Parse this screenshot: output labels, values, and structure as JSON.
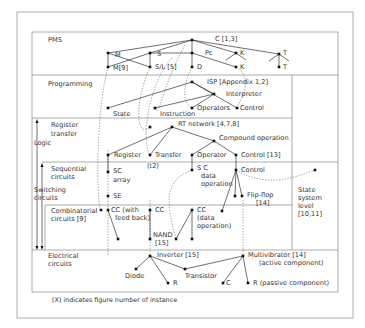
{
  "caption": "[X] indicates figure number of instance",
  "levels": {
    "pms": "PMS",
    "programming": "Programming",
    "register_transfer": [
      "Register",
      "transfer"
    ],
    "logic": "Logic",
    "sequential": [
      "Sequential",
      "circuits"
    ],
    "switching": [
      "Switching",
      "circuits"
    ],
    "combinatorial": [
      "Combinatorial",
      "circuits [9]"
    ],
    "electrical": [
      "Electrical",
      "circuits"
    ],
    "state_system": [
      "State",
      "system",
      "level",
      "[10,11]"
    ]
  },
  "nodes": [
    {
      "id": "C",
      "x": 192,
      "y": 40,
      "label": "C [1,3]",
      "lx": 215,
      "ly": 41
    },
    {
      "id": "M",
      "x": 108,
      "y": 53,
      "label": "M",
      "lx": 115,
      "ly": 57
    },
    {
      "id": "S",
      "x": 150,
      "y": 53,
      "label": "S",
      "lx": 157,
      "ly": 56
    },
    {
      "id": "Pc",
      "x": 192,
      "y": 53,
      "label": "Pc",
      "lx": 205,
      "ly": 55
    },
    {
      "id": "K1",
      "x": 236,
      "y": 53,
      "label": "K",
      "lx": 240,
      "ly": 55
    },
    {
      "id": "T1",
      "x": 279,
      "y": 54,
      "label": "T",
      "lx": 283,
      "ly": 55
    },
    {
      "id": "M9",
      "x": 108,
      "y": 67,
      "label": "M[9]",
      "lx": 113,
      "ly": 70
    },
    {
      "id": "SL",
      "x": 150,
      "y": 67,
      "label": "S/L [5]",
      "lx": 155,
      "ly": 69
    },
    {
      "id": "D",
      "x": 192,
      "y": 67,
      "label": "D",
      "lx": 197,
      "ly": 69
    },
    {
      "id": "K2",
      "x": 236,
      "y": 67,
      "label": "K",
      "lx": 240,
      "ly": 69
    },
    {
      "id": "T2",
      "x": 279,
      "y": 67,
      "label": "T",
      "lx": 283,
      "ly": 69
    },
    {
      "id": "ISP",
      "x": 192,
      "y": 82,
      "label": "ISP [Appendix 1,2]",
      "lx": 207,
      "ly": 84
    },
    {
      "id": "Interp",
      "x": 214,
      "y": 94,
      "label": "Interpreter",
      "lx": 226,
      "ly": 96
    },
    {
      "id": "State",
      "x": 108,
      "y": 108,
      "label": "State",
      "lx": 113,
      "ly": 116
    },
    {
      "id": "Instr",
      "x": 155,
      "y": 108,
      "label": "Instruction",
      "lx": 160,
      "ly": 116
    },
    {
      "id": "Oper",
      "x": 192,
      "y": 108,
      "label": "Operators",
      "lx": 197,
      "ly": 110
    },
    {
      "id": "Ctrl1",
      "x": 237,
      "y": 108,
      "label": "Control",
      "lx": 240,
      "ly": 110
    },
    {
      "id": "RTdot",
      "x": 150,
      "y": 127,
      "label": "",
      "lx": 0,
      "ly": 0
    },
    {
      "id": "RT",
      "x": 172,
      "y": 127,
      "label": "RT network  [4,7,8]",
      "lx": 178,
      "ly": 126
    },
    {
      "id": "Comp",
      "x": 214,
      "y": 141,
      "label": "Compound operation",
      "lx": 219,
      "ly": 140
    },
    {
      "id": "Reg",
      "x": 108,
      "y": 155,
      "label": "Register",
      "lx": 114,
      "ly": 157
    },
    {
      "id": "Trans",
      "x": 150,
      "y": 155,
      "label": "Transfer",
      "lx": 155,
      "ly": 157
    },
    {
      "id": "Operator",
      "x": 192,
      "y": 155,
      "label": "Operator",
      "lx": 197,
      "ly": 157
    },
    {
      "id": "Ctrl13",
      "x": 236,
      "y": 155,
      "label": "Control [13]",
      "lx": 241,
      "ly": 157
    },
    {
      "id": "SCarr",
      "x": 108,
      "y": 172,
      "label": "",
      "lx": 0,
      "ly": 0
    },
    {
      "id": "SCdata",
      "x": 192,
      "y": 170,
      "label": "",
      "lx": 0,
      "ly": 0
    },
    {
      "id": "Ctrl2",
      "x": 236,
      "y": 170,
      "label": "Control",
      "lx": 241,
      "ly": 172
    },
    {
      "id": "FarR",
      "x": 315,
      "y": 170,
      "label": "",
      "lx": 0,
      "ly": 0
    },
    {
      "id": "FF1",
      "x": 235,
      "y": 196,
      "label": "",
      "lx": 0,
      "ly": 0
    },
    {
      "id": "FF2",
      "x": 242,
      "y": 196,
      "label": "",
      "lx": 0,
      "ly": 0
    },
    {
      "id": "SE",
      "x": 108,
      "y": 196,
      "label": "SE",
      "lx": 113,
      "ly": 198
    },
    {
      "id": "CCfb",
      "x": 108,
      "y": 210,
      "label": "",
      "lx": 0,
      "ly": 0
    },
    {
      "id": "CCleft",
      "x": 101,
      "y": 210,
      "label": "",
      "lx": 0,
      "ly": 0
    },
    {
      "id": "CCfbEnd",
      "x": 118,
      "y": 239,
      "label": "",
      "lx": 0,
      "ly": 0
    },
    {
      "id": "CC",
      "x": 150,
      "y": 210,
      "label": "CC",
      "lx": 155,
      "ly": 212
    },
    {
      "id": "CCdata",
      "x": 192,
      "y": 210,
      "label": "",
      "lx": 0,
      "ly": 0
    },
    {
      "id": "CCdataDot",
      "x": 222,
      "y": 211,
      "label": "",
      "lx": 0,
      "ly": 0
    },
    {
      "id": "NAND",
      "x": 150,
      "y": 239,
      "label": "",
      "lx": 0,
      "ly": 0
    },
    {
      "id": "CCd1",
      "x": 176,
      "y": 239,
      "label": "",
      "lx": 0,
      "ly": 0
    },
    {
      "id": "CCd2",
      "x": 192,
      "y": 239,
      "label": "",
      "lx": 0,
      "ly": 0
    },
    {
      "id": "Inv",
      "x": 150,
      "y": 256,
      "label": "Inverter [15]",
      "lx": 157,
      "ly": 257
    },
    {
      "id": "Diode",
      "x": 136,
      "y": 269,
      "label": "Diode",
      "lx": 125,
      "ly": 278
    },
    {
      "id": "R1",
      "x": 168,
      "y": 283,
      "label": "R",
      "lx": 173,
      "ly": 285
    },
    {
      "id": "Transistor",
      "x": 185,
      "y": 269,
      "label": "Transistor",
      "lx": 185,
      "ly": 278
    },
    {
      "id": "Multi",
      "x": 243,
      "y": 256,
      "label": "Multivibrator [14]",
      "lx": 248,
      "ly": 257
    },
    {
      "id": "C2",
      "x": 223,
      "y": 283,
      "label": "C",
      "lx": 226,
      "ly": 285
    },
    {
      "id": "R2",
      "x": 248,
      "y": 283,
      "label": "R  (passive component)",
      "lx": 253,
      "ly": 285
    }
  ],
  "extra_labels": [
    {
      "text": "SC",
      "x": 113,
      "y": 173
    },
    {
      "text": "array",
      "x": 113,
      "y": 182
    },
    {
      "text": "(t2)",
      "x": 147,
      "y": 168
    },
    {
      "text": "S C",
      "x": 197,
      "y": 170
    },
    {
      "text": "data",
      "x": 201,
      "y": 178
    },
    {
      "text": "operation",
      "x": 201,
      "y": 186
    },
    {
      "text": "Flip-flop",
      "x": 247,
      "y": 197
    },
    {
      "text": "[14]",
      "x": 256,
      "y": 205
    },
    {
      "text": "CC (with",
      "x": 111,
      "y": 212
    },
    {
      "text": "feed back)",
      "x": 115,
      "y": 220
    },
    {
      "text": "CC",
      "x": 197,
      "y": 212
    },
    {
      "text": "(data",
      "x": 197,
      "y": 220
    },
    {
      "text": "operation)",
      "x": 197,
      "y": 228
    },
    {
      "text": "NAND",
      "x": 153,
      "y": 237
    },
    {
      "text": "[15]",
      "x": 155,
      "y": 245
    },
    {
      "text": "(active component)",
      "x": 259,
      "y": 265
    }
  ],
  "edges": [
    [
      "C",
      "M"
    ],
    [
      "C",
      "S"
    ],
    [
      "C",
      "Pc"
    ],
    [
      "C",
      "K1"
    ],
    [
      "C",
      "T1"
    ],
    [
      "M",
      "M9"
    ],
    [
      "M",
      "SL"
    ],
    [
      "S",
      "M9"
    ],
    [
      "S",
      "SL"
    ],
    [
      "S",
      "Pc"
    ],
    [
      "Pc",
      "D"
    ],
    [
      "Pc",
      "K2"
    ],
    [
      "T1",
      "T2"
    ],
    [
      "ISP",
      "State"
    ],
    [
      "ISP",
      "Interp"
    ],
    [
      "Interp",
      "Instr"
    ],
    [
      "Interp",
      "Oper"
    ],
    [
      "ISP",
      "Ctrl1"
    ],
    [
      "RT",
      "Reg"
    ],
    [
      "RT",
      "Trans"
    ],
    [
      "RT",
      "Comp"
    ],
    [
      "Comp",
      "Operator"
    ],
    [
      "Comp",
      "Ctrl13"
    ],
    [
      "Reg",
      "SCarr"
    ],
    [
      "Operator",
      "SCdata"
    ],
    [
      "Ctrl13",
      "Ctrl2"
    ],
    [
      "Ctrl2",
      "FF1"
    ],
    [
      "Ctrl2",
      "FF2"
    ],
    [
      "Ctrl2",
      "CCdataDot"
    ],
    [
      "CCfb",
      "CCfbEnd"
    ],
    [
      "CC",
      "NAND"
    ],
    [
      "CCdata",
      "CCd1"
    ],
    [
      "CCdata",
      "CCd2"
    ],
    [
      "Inv",
      "Diode"
    ],
    [
      "Inv",
      "R1"
    ],
    [
      "Inv",
      "Transistor"
    ],
    [
      "Transistor",
      "Multi"
    ],
    [
      "Multi",
      "C2"
    ],
    [
      "Multi",
      "R2"
    ]
  ],
  "stubs": [
    [
      236,
      53,
      226,
      60
    ],
    [
      236,
      53,
      246,
      60
    ],
    [
      279,
      54,
      269,
      61
    ],
    [
      279,
      54,
      289,
      61
    ]
  ],
  "dashed": [
    "M108,67 C96,110 96,200 101,210",
    "M150,67 C135,100 135,140 150,127",
    "M172,58 C150,80 140,140 150,155",
    "M185,45 C160,90 160,120 155,108",
    "M192,67 C180,90 185,105 192,108",
    "M236,67 C255,80 240,100 237,108",
    "M192,170 C165,180 165,200 176,239",
    "M236,170 C270,190 300,175 315,170",
    "M108,150 L108,256",
    "M150,200 L150,256",
    "M243,200 L243,256"
  ]
}
